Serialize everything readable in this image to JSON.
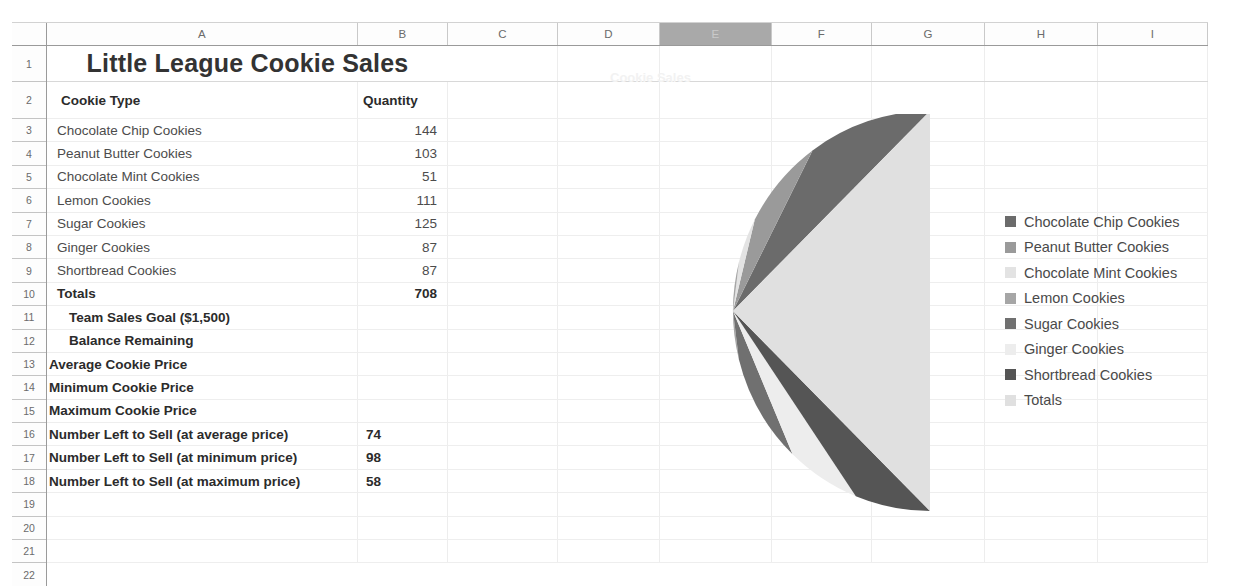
{
  "spreadsheet": {
    "columns": [
      "A",
      "B",
      "C",
      "D",
      "E",
      "F",
      "G",
      "H",
      "I"
    ],
    "selected_column": "E",
    "row_numbers": [
      "1",
      "2",
      "3",
      "4",
      "5",
      "6",
      "7",
      "8",
      "9",
      "10",
      "11",
      "12",
      "13",
      "14",
      "15",
      "16",
      "17",
      "18",
      "19",
      "20",
      "21",
      "22"
    ],
    "title": "Little League Cookie Sales",
    "headers": {
      "cookie_type": "Cookie Type",
      "quantity": "Quantity"
    },
    "rows": [
      {
        "row": "3",
        "label": "Chocolate Chip Cookies",
        "value": "144",
        "style": "normal",
        "indent": "indent-3",
        "align": "right"
      },
      {
        "row": "4",
        "label": "Peanut Butter Cookies",
        "value": "103",
        "style": "normal",
        "indent": "indent-3",
        "align": "right"
      },
      {
        "row": "5",
        "label": "Chocolate Mint Cookies",
        "value": "51",
        "style": "normal",
        "indent": "indent-3",
        "align": "right"
      },
      {
        "row": "6",
        "label": "Lemon Cookies",
        "value": "111",
        "style": "normal",
        "indent": "indent-3",
        "align": "right"
      },
      {
        "row": "7",
        "label": "Sugar Cookies",
        "value": "125",
        "style": "normal",
        "indent": "indent-3",
        "align": "right"
      },
      {
        "row": "8",
        "label": "Ginger Cookies",
        "value": "87",
        "style": "normal",
        "indent": "indent-3",
        "align": "right"
      },
      {
        "row": "9",
        "label": "Shortbread Cookies",
        "value": "87",
        "style": "normal",
        "indent": "indent-3",
        "align": "right"
      },
      {
        "row": "10",
        "label": "Totals",
        "value": "708",
        "style": "bold",
        "indent": "indent-3",
        "align": "right"
      },
      {
        "row": "11",
        "label": "Team Sales Goal ($1,500)",
        "value": "",
        "style": "bold",
        "indent": "indent-2",
        "align": "right"
      },
      {
        "row": "12",
        "label": "Balance Remaining",
        "value": "",
        "style": "bold",
        "indent": "indent-2",
        "align": "right"
      },
      {
        "row": "13",
        "label": "Average Cookie Price",
        "value": "",
        "style": "bold",
        "indent": "indent-0",
        "align": "right"
      },
      {
        "row": "14",
        "label": "Minimum Cookie Price",
        "value": "",
        "style": "bold",
        "indent": "indent-0",
        "align": "right"
      },
      {
        "row": "15",
        "label": "Maximum Cookie Price",
        "value": "",
        "style": "bold",
        "indent": "indent-0",
        "align": "right"
      },
      {
        "row": "16",
        "label": "Number Left to Sell (at average price)",
        "value": "74",
        "style": "bold",
        "indent": "indent-0",
        "align": "left"
      },
      {
        "row": "17",
        "label": "Number Left to Sell (at minimum price)",
        "value": "98",
        "style": "bold",
        "indent": "indent-0",
        "align": "left"
      },
      {
        "row": "18",
        "label": "Number Left to Sell (at maximum price)",
        "value": "58",
        "style": "bold",
        "indent": "indent-0",
        "align": "left"
      },
      {
        "row": "19",
        "label": "",
        "value": "",
        "style": "normal",
        "indent": "indent-0",
        "align": "right"
      },
      {
        "row": "20",
        "label": "",
        "value": "",
        "style": "normal",
        "indent": "indent-0",
        "align": "right"
      },
      {
        "row": "21",
        "label": "",
        "value": "",
        "style": "normal",
        "indent": "indent-0",
        "align": "right"
      }
    ]
  },
  "chart_data": {
    "type": "pie",
    "title": "Cookie Sales",
    "categories": [
      "Chocolate Chip Cookies",
      "Peanut Butter Cookies",
      "Chocolate Mint Cookies",
      "Lemon Cookies",
      "Sugar Cookies",
      "Ginger Cookies",
      "Shortbread Cookies",
      "Totals"
    ],
    "values": [
      144,
      103,
      51,
      111,
      125,
      87,
      87,
      708
    ],
    "colors": [
      "#6b6b6b",
      "#9a9a9a",
      "#e3e3e3",
      "#a6a6a6",
      "#707070",
      "#ededed",
      "#555555",
      "#e0e0e0"
    ],
    "legend_position": "right",
    "start_angle_deg": 0,
    "direction": "counterclockwise",
    "total": 1416
  }
}
